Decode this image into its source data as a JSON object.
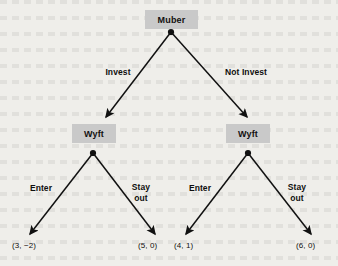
{
  "diagram": {
    "type": "extensive-form-game-tree",
    "background_color": "#efeeea",
    "node_fill_color": "#c9c9c9",
    "line_color": "#111111",
    "nodes": [
      {
        "id": "root",
        "label": "Muber",
        "player": "Muber",
        "x": 171,
        "y": 32
      },
      {
        "id": "wyft-left",
        "label": "Wyft",
        "player": "Wyft",
        "x": 93,
        "y": 153
      },
      {
        "id": "wyft-right",
        "label": "Wyft",
        "player": "Wyft",
        "x": 248,
        "y": 153
      }
    ],
    "edges": [
      {
        "from": "root",
        "to": "wyft-left",
        "label": "Invest"
      },
      {
        "from": "root",
        "to": "wyft-right",
        "label": "Not Invest"
      },
      {
        "from": "wyft-left",
        "to": "payoff-1",
        "label": "Enter"
      },
      {
        "from": "wyft-left",
        "to": "payoff-2",
        "label": "Stay\nout"
      },
      {
        "from": "wyft-right",
        "to": "payoff-3",
        "label": "Enter"
      },
      {
        "from": "wyft-right",
        "to": "payoff-4",
        "label": "Stay\nout"
      }
    ],
    "payoffs": [
      {
        "id": "payoff-1",
        "text": "(3, −2)",
        "muber": 3,
        "wyft": -2
      },
      {
        "id": "payoff-2",
        "text": "(5, 0)",
        "muber": 5,
        "wyft": 0
      },
      {
        "id": "payoff-3",
        "text": "(4, 1)",
        "muber": 4,
        "wyft": 1
      },
      {
        "id": "payoff-4",
        "text": "(6, 0)",
        "muber": 6,
        "wyft": 0
      }
    ]
  }
}
